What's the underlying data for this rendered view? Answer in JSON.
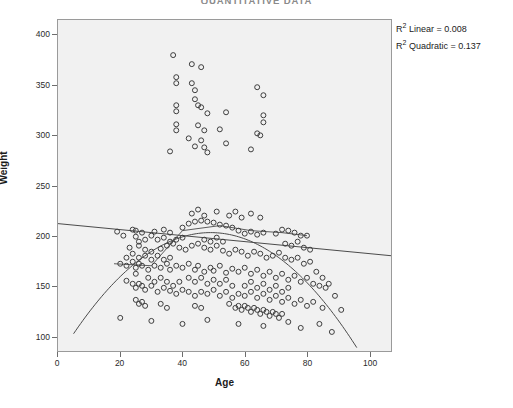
{
  "chart_title": "QUANTITATIVE DATA",
  "axes": {
    "x": {
      "label": "Age",
      "ticks": [
        0,
        20,
        40,
        60,
        80,
        100
      ],
      "min": 0,
      "max": 107
    },
    "y": {
      "label": "Weight",
      "ticks": [
        400,
        350,
        300,
        250,
        200,
        150,
        100
      ],
      "min": 85,
      "max": 415
    }
  },
  "annotations": {
    "r2_linear_prefix": "R",
    "r2_linear_sup": "2",
    "r2_linear_text": " Linear = 0.008",
    "r2_quadratic_prefix": "R",
    "r2_quadratic_sup": "2",
    "r2_quadratic_text": " Quadratic = 0.137",
    "r2_linear_full": "R² Linear = 0.008",
    "r2_quadratic_full": "R² Quadratic = 0.137"
  },
  "colors": {
    "plot_background": "#f1f1f1",
    "frame_border": "#9a9a9a",
    "marker_stroke": "#3c3c3c",
    "fit_line": "#4a4a4a",
    "tick": "#6d6d6d",
    "text": "#1b1b1b",
    "title": "#8a8a8a"
  },
  "chart_data": {
    "type": "scatter",
    "title": "QUANTITATIVE DATA",
    "xlabel": "Age",
    "ylabel": "Weight",
    "xlim": [
      0,
      107
    ],
    "ylim": [
      85,
      415
    ],
    "grid": false,
    "legend": "none",
    "marker": {
      "shape": "circle",
      "filled": false,
      "size": 5,
      "stroke": "#3c3c3c"
    },
    "fits": [
      {
        "name": "Linear",
        "type": "linear",
        "r_squared": 0.008,
        "endpoints": [
          [
            0,
            212
          ],
          [
            107,
            180
          ]
        ],
        "slope": -0.3,
        "intercept": 212
      },
      {
        "name": "Quadratic",
        "type": "quadratic",
        "r_squared": 0.137,
        "vertex": [
          49,
          203
        ],
        "x_range": [
          5,
          96
        ],
        "coefficients": {
          "a": -0.052,
          "b": 5.1,
          "c": 78
        }
      }
    ],
    "points": [
      [
        37,
        380
      ],
      [
        43,
        371
      ],
      [
        46,
        368
      ],
      [
        38,
        358
      ],
      [
        38,
        352
      ],
      [
        43,
        352
      ],
      [
        44,
        345
      ],
      [
        64,
        348
      ],
      [
        66,
        340
      ],
      [
        44,
        336
      ],
      [
        45,
        330
      ],
      [
        38,
        330
      ],
      [
        38,
        324
      ],
      [
        46,
        328
      ],
      [
        48,
        322
      ],
      [
        54,
        323
      ],
      [
        66,
        320
      ],
      [
        66,
        313
      ],
      [
        38,
        311
      ],
      [
        38,
        305
      ],
      [
        45,
        310
      ],
      [
        47,
        305
      ],
      [
        52,
        306
      ],
      [
        64,
        302
      ],
      [
        65,
        300
      ],
      [
        42,
        297
      ],
      [
        46,
        295
      ],
      [
        54,
        292
      ],
      [
        44,
        289
      ],
      [
        47,
        288
      ],
      [
        36,
        284
      ],
      [
        48,
        283
      ],
      [
        62,
        286
      ],
      [
        24,
        206
      ],
      [
        25,
        205
      ],
      [
        25,
        199
      ],
      [
        27,
        203
      ],
      [
        31,
        204
      ],
      [
        34,
        206
      ],
      [
        36,
        203
      ],
      [
        40,
        208
      ],
      [
        42,
        212
      ],
      [
        44,
        214
      ],
      [
        46,
        215
      ],
      [
        48,
        214
      ],
      [
        50,
        213
      ],
      [
        52,
        211
      ],
      [
        54,
        210
      ],
      [
        56,
        208
      ],
      [
        58,
        205
      ],
      [
        60,
        202
      ],
      [
        62,
        204
      ],
      [
        64,
        201
      ],
      [
        66,
        203
      ],
      [
        70,
        202
      ],
      [
        72,
        206
      ],
      [
        74,
        205
      ],
      [
        76,
        203
      ],
      [
        78,
        200
      ],
      [
        80,
        200
      ],
      [
        23,
        188
      ],
      [
        26,
        190
      ],
      [
        28,
        186
      ],
      [
        30,
        184
      ],
      [
        33,
        187
      ],
      [
        35,
        190
      ],
      [
        37,
        192
      ],
      [
        39,
        188
      ],
      [
        41,
        186
      ],
      [
        43,
        190
      ],
      [
        45,
        192
      ],
      [
        47,
        188
      ],
      [
        49,
        186
      ],
      [
        51,
        190
      ],
      [
        53,
        185
      ],
      [
        55,
        182
      ],
      [
        57,
        186
      ],
      [
        59,
        184
      ],
      [
        61,
        180
      ],
      [
        63,
        184
      ],
      [
        65,
        182
      ],
      [
        67,
        178
      ],
      [
        69,
        180
      ],
      [
        71,
        183
      ],
      [
        73,
        178
      ],
      [
        75,
        176
      ],
      [
        77,
        178
      ],
      [
        79,
        172
      ],
      [
        81,
        174
      ],
      [
        20,
        172
      ],
      [
        22,
        170
      ],
      [
        24,
        174
      ],
      [
        25,
        168
      ],
      [
        26,
        172
      ],
      [
        27,
        170
      ],
      [
        29,
        166
      ],
      [
        31,
        170
      ],
      [
        33,
        168
      ],
      [
        35,
        172
      ],
      [
        36,
        166
      ],
      [
        38,
        170
      ],
      [
        40,
        168
      ],
      [
        42,
        172
      ],
      [
        44,
        166
      ],
      [
        45,
        170
      ],
      [
        47,
        164
      ],
      [
        49,
        168
      ],
      [
        50,
        165
      ],
      [
        52,
        170
      ],
      [
        54,
        163
      ],
      [
        56,
        167
      ],
      [
        58,
        164
      ],
      [
        60,
        168
      ],
      [
        62,
        162
      ],
      [
        64,
        166
      ],
      [
        66,
        160
      ],
      [
        68,
        164
      ],
      [
        70,
        158
      ],
      [
        72,
        162
      ],
      [
        74,
        156
      ],
      [
        76,
        160
      ],
      [
        78,
        154
      ],
      [
        80,
        158
      ],
      [
        82,
        152
      ],
      [
        84,
        150
      ],
      [
        86,
        148
      ],
      [
        22,
        155
      ],
      [
        24,
        152
      ],
      [
        25,
        148
      ],
      [
        26,
        152
      ],
      [
        27,
        150
      ],
      [
        28,
        146
      ],
      [
        30,
        150
      ],
      [
        32,
        144
      ],
      [
        34,
        148
      ],
      [
        36,
        145
      ],
      [
        38,
        142
      ],
      [
        40,
        146
      ],
      [
        42,
        144
      ],
      [
        44,
        140
      ],
      [
        46,
        144
      ],
      [
        48,
        142
      ],
      [
        50,
        146
      ],
      [
        52,
        140
      ],
      [
        54,
        144
      ],
      [
        56,
        138
      ],
      [
        58,
        142
      ],
      [
        60,
        140
      ],
      [
        62,
        144
      ],
      [
        64,
        138
      ],
      [
        66,
        142
      ],
      [
        68,
        136
      ],
      [
        70,
        140
      ],
      [
        72,
        134
      ],
      [
        74,
        138
      ],
      [
        76,
        132
      ],
      [
        78,
        136
      ],
      [
        80,
        130
      ],
      [
        82,
        134
      ],
      [
        85,
        128
      ],
      [
        25,
        136
      ],
      [
        26,
        132
      ],
      [
        27,
        134
      ],
      [
        28,
        130
      ],
      [
        33,
        132
      ],
      [
        35,
        128
      ],
      [
        44,
        130
      ],
      [
        46,
        128
      ],
      [
        55,
        132
      ],
      [
        57,
        128
      ],
      [
        58,
        130
      ],
      [
        59,
        126
      ],
      [
        60,
        130
      ],
      [
        61,
        128
      ],
      [
        62,
        124
      ],
      [
        63,
        128
      ],
      [
        64,
        126
      ],
      [
        65,
        122
      ],
      [
        66,
        126
      ],
      [
        67,
        124
      ],
      [
        68,
        120
      ],
      [
        69,
        124
      ],
      [
        70,
        122
      ],
      [
        71,
        118
      ],
      [
        72,
        122
      ],
      [
        20,
        118
      ],
      [
        30,
        115
      ],
      [
        40,
        112
      ],
      [
        48,
        116
      ],
      [
        58,
        112
      ],
      [
        66,
        110
      ],
      [
        74,
        114
      ],
      [
        78,
        108
      ],
      [
        84,
        112
      ],
      [
        88,
        104
      ],
      [
        19,
        204
      ],
      [
        21,
        200
      ],
      [
        25,
        162
      ],
      [
        29,
        158
      ],
      [
        31,
        154
      ],
      [
        33,
        158
      ],
      [
        35,
        154
      ],
      [
        37,
        150
      ],
      [
        39,
        154
      ],
      [
        47,
        196
      ],
      [
        49,
        194
      ],
      [
        51,
        198
      ],
      [
        53,
        194
      ],
      [
        73,
        192
      ],
      [
        75,
        190
      ],
      [
        77,
        194
      ],
      [
        79,
        188
      ],
      [
        81,
        186
      ],
      [
        83,
        164
      ],
      [
        85,
        158
      ],
      [
        87,
        152
      ],
      [
        89,
        140
      ],
      [
        91,
        126
      ],
      [
        43,
        222
      ],
      [
        45,
        226
      ],
      [
        47,
        220
      ],
      [
        51,
        224
      ],
      [
        55,
        220
      ],
      [
        57,
        224
      ],
      [
        59,
        218
      ],
      [
        62,
        222
      ],
      [
        65,
        218
      ],
      [
        36,
        178
      ],
      [
        34,
        176
      ],
      [
        32,
        180
      ],
      [
        30,
        176
      ],
      [
        28,
        180
      ],
      [
        26,
        178
      ],
      [
        24,
        182
      ],
      [
        22,
        178
      ],
      [
        42,
        158
      ],
      [
        44,
        154
      ],
      [
        46,
        158
      ],
      [
        48,
        152
      ],
      [
        50,
        156
      ],
      [
        52,
        152
      ],
      [
        54,
        156
      ],
      [
        56,
        150
      ],
      [
        60,
        150
      ],
      [
        62,
        154
      ],
      [
        64,
        148
      ],
      [
        66,
        152
      ],
      [
        68,
        146
      ],
      [
        70,
        150
      ],
      [
        72,
        144
      ],
      [
        74,
        148
      ],
      [
        38,
        196
      ],
      [
        40,
        198
      ],
      [
        36,
        194
      ],
      [
        34,
        198
      ],
      [
        28,
        196
      ],
      [
        26,
        194
      ],
      [
        30,
        200
      ],
      [
        32,
        196
      ]
    ]
  }
}
